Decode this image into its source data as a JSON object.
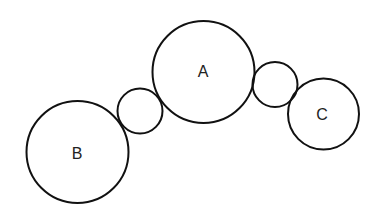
{
  "diagram": {
    "type": "gear-train-circles",
    "circles": [
      {
        "id": "B",
        "label": "B",
        "cx": 77.5,
        "cy": 152,
        "r": 51
      },
      {
        "id": "idler-left",
        "label": "",
        "cx": 140,
        "cy": 111,
        "r": 22.5
      },
      {
        "id": "A",
        "label": "A",
        "cx": 203.5,
        "cy": 72,
        "r": 51
      },
      {
        "id": "idler-right",
        "label": "",
        "cx": 275,
        "cy": 84.5,
        "r": 22.5
      },
      {
        "id": "C",
        "label": "C",
        "cx": 323.5,
        "cy": 114,
        "r": 35.5
      }
    ],
    "labels": {
      "a": "A",
      "b": "B",
      "c": "C"
    },
    "stroke_color": "#111111",
    "background": "#ffffff"
  }
}
